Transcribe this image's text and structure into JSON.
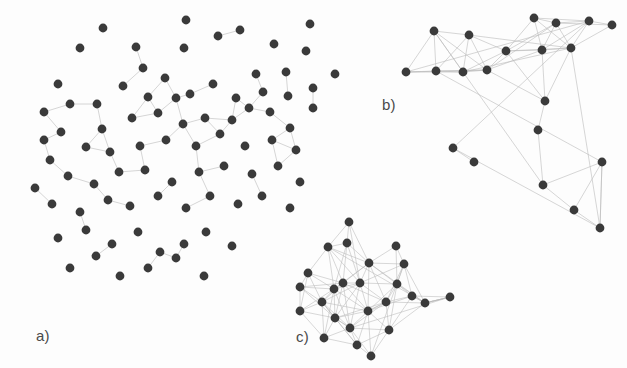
{
  "figure": {
    "width": 627,
    "height": 368,
    "background_color": "#fdfdfd",
    "node_color": "#3a3a3a",
    "edge_color": "#b9b9b9",
    "node_radius": 4.4
  },
  "labels": {
    "panel_a": "a)",
    "panel_b": "b)",
    "panel_c": "c)"
  },
  "chart_data": {
    "type": "scatter",
    "title": "",
    "xlabel": "",
    "ylabel": "",
    "panels": [
      {
        "id": "a",
        "label": "a)",
        "label_position": [
          36,
          327
        ],
        "node_count": 84,
        "edge_count": 62,
        "density": "sparse",
        "nodes": [
          [
            103,
            28
          ],
          [
            186,
            20
          ],
          [
            136,
            47
          ],
          [
            80,
            48
          ],
          [
            240,
            30
          ],
          [
            184,
            48
          ],
          [
            58,
            84
          ],
          [
            143,
            68
          ],
          [
            218,
            36
          ],
          [
            274,
            44
          ],
          [
            256,
            74
          ],
          [
            306,
            51
          ],
          [
            165,
            78
          ],
          [
            310,
            24
          ],
          [
            190,
            94
          ],
          [
            44,
            112
          ],
          [
            70,
            104
          ],
          [
            97,
            104
          ],
          [
            123,
            86
          ],
          [
            148,
            97
          ],
          [
            176,
            98
          ],
          [
            213,
            84
          ],
          [
            236,
            98
          ],
          [
            263,
            92
          ],
          [
            286,
            72
          ],
          [
            335,
            74
          ],
          [
            288,
            96
          ],
          [
            313,
            108
          ],
          [
            44,
            140
          ],
          [
            61,
            132
          ],
          [
            102,
            129
          ],
          [
            132,
            118
          ],
          [
            158,
            113
          ],
          [
            183,
            124
          ],
          [
            205,
            118
          ],
          [
            232,
            120
          ],
          [
            249,
            108
          ],
          [
            270,
            112
          ],
          [
            290,
            128
          ],
          [
            313,
            88
          ],
          [
            50,
            160
          ],
          [
            86,
            147
          ],
          [
            110,
            152
          ],
          [
            140,
            146
          ],
          [
            166,
            140
          ],
          [
            196,
            146
          ],
          [
            220,
            134
          ],
          [
            245,
            146
          ],
          [
            272,
            140
          ],
          [
            296,
            150
          ],
          [
            35,
            188
          ],
          [
            68,
            176
          ],
          [
            94,
            184
          ],
          [
            119,
            172
          ],
          [
            145,
            170
          ],
          [
            172,
            182
          ],
          [
            199,
            172
          ],
          [
            224,
            166
          ],
          [
            252,
            174
          ],
          [
            278,
            166
          ],
          [
            300,
            182
          ],
          [
            52,
            204
          ],
          [
            80,
            212
          ],
          [
            108,
            200
          ],
          [
            130,
            206
          ],
          [
            158,
            196
          ],
          [
            186,
            208
          ],
          [
            210,
            196
          ],
          [
            238,
            204
          ],
          [
            262,
            196
          ],
          [
            290,
            208
          ],
          [
            58,
            238
          ],
          [
            86,
            230
          ],
          [
            112,
            244
          ],
          [
            138,
            232
          ],
          [
            160,
            252
          ],
          [
            184,
            244
          ],
          [
            206,
            232
          ],
          [
            232,
            246
          ],
          [
            70,
            268
          ],
          [
            96,
            256
          ],
          [
            120,
            276
          ],
          [
            148,
            268
          ],
          [
            176,
            258
          ],
          [
            204,
            276
          ]
        ]
      },
      {
        "id": "b",
        "label": "b)",
        "label_position": [
          382,
          96
        ],
        "node_count": 21,
        "edge_count": 46,
        "density": "medium",
        "nodes": [
          [
            434,
            31
          ],
          [
            469,
            35
          ],
          [
            534,
            18
          ],
          [
            556,
            23
          ],
          [
            589,
            21
          ],
          [
            406,
            72
          ],
          [
            436,
            71
          ],
          [
            463,
            72
          ],
          [
            487,
            70
          ],
          [
            506,
            51
          ],
          [
            571,
            48
          ],
          [
            612,
            25
          ],
          [
            453,
            148
          ],
          [
            474,
            162
          ],
          [
            542,
            50
          ],
          [
            545,
            101
          ],
          [
            538,
            130
          ],
          [
            543,
            185
          ],
          [
            574,
            210
          ],
          [
            602,
            162
          ],
          [
            600,
            228
          ]
        ]
      },
      {
        "id": "c",
        "label": "c)",
        "label_position": [
          296,
          328
        ],
        "node_count": 25,
        "edge_count": 96,
        "density": "dense",
        "nodes": [
          [
            349,
            222
          ],
          [
            347,
            243
          ],
          [
            328,
            247
          ],
          [
            396,
            246
          ],
          [
            308,
            273
          ],
          [
            343,
            283
          ],
          [
            360,
            283
          ],
          [
            300,
            287
          ],
          [
            369,
            263
          ],
          [
            404,
            264
          ],
          [
            397,
            284
          ],
          [
            334,
            289
          ],
          [
            412,
            296
          ],
          [
            322,
            302
          ],
          [
            386,
            302
          ],
          [
            335,
            318
          ],
          [
            300,
            311
          ],
          [
            368,
            311
          ],
          [
            450,
            297
          ],
          [
            425,
            303
          ],
          [
            350,
            328
          ],
          [
            389,
            330
          ],
          [
            324,
            338
          ],
          [
            357,
            345
          ],
          [
            371,
            356
          ]
        ]
      }
    ]
  }
}
